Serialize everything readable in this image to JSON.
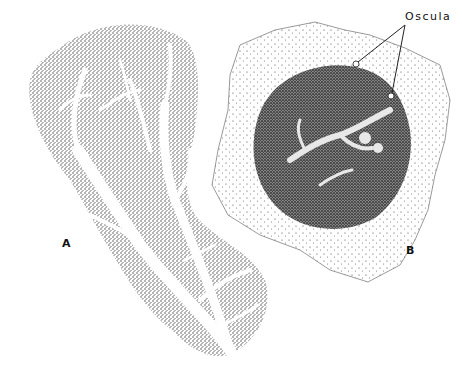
{
  "figure": {
    "labels": {
      "a": "A",
      "b": "B",
      "callout": "Oscula"
    },
    "specimens": [
      {
        "id": "A",
        "description": "branching sponge with canal system",
        "shape": "elongated lobed body"
      },
      {
        "id": "B",
        "description": "encrusting sponge with dark central mass and oscula",
        "shape": "polygonal membrane"
      }
    ],
    "colors": {
      "background": "#ffffff",
      "stipple": "#222222",
      "dark_mass": "#4a4a4a",
      "canal": "#ffffff"
    }
  }
}
